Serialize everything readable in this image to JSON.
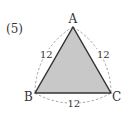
{
  "problem_number": "(5)",
  "figure": {
    "shape": "Reuleaux triangle over equilateral triangle",
    "fill_color": "#c8c8c8",
    "stroke_color": "#333333",
    "arc_color": "#999999",
    "vertices": [
      {
        "label": "A",
        "x": 73,
        "y": 27
      },
      {
        "label": "B",
        "x": 35,
        "y": 93
      },
      {
        "label": "C",
        "x": 111,
        "y": 93
      }
    ],
    "side_labels": {
      "AB": "12",
      "AC": "12",
      "BC": "12"
    }
  }
}
